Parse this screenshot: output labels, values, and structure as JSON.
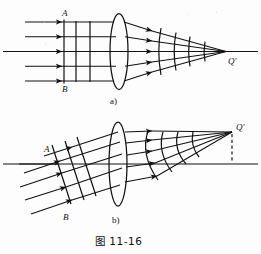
{
  "figure": {
    "caption": "图    11-16",
    "background_color": "#fdfdfd",
    "ink_color": "#111111",
    "panels": [
      {
        "id": "a",
        "part_label": "a)",
        "description": "Parallel on-axis beam converging through a lens to the focal point Q'",
        "labels": {
          "upper_edge_ray": "A",
          "lower_edge_ray": "B",
          "focus_point": "Q'"
        },
        "optical_axis": true,
        "ray_count": 5,
        "incident_wavefronts": 3,
        "emergent_wavefronts": 4,
        "lens": "biconvex-converging",
        "dashed_drop_line": false
      },
      {
        "id": "b",
        "part_label": "b)",
        "description": "Oblique parallel beam converging through a lens to an off-axis focal point Q'",
        "labels": {
          "upper_edge_ray": "A",
          "lower_edge_ray": "B",
          "focus_point": "Q'"
        },
        "optical_axis": true,
        "ray_count": 5,
        "incident_wavefronts": 3,
        "emergent_wavefronts": 4,
        "lens": "biconvex-converging",
        "dashed_drop_line": true
      }
    ]
  }
}
